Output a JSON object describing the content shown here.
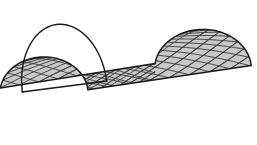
{
  "figure": {
    "kind": "geometric-surface-diagram",
    "background_color": "#ffffff",
    "canvas": {
      "width": 257,
      "height": 145
    }
  },
  "style": {
    "surface_fill_color": "#c9c9c9",
    "mesh_line_color": "#3a3a3a",
    "outline_color": "#1a1a1a",
    "arch_line_color": "#1a1a1a",
    "mesh_line_width": 0.9,
    "outline_width": 1.5,
    "arch_line_width": 1.4
  },
  "geometry": {
    "description": "Half cylinder (barrel vault) drawn in oblique parallel projection. Axis runs from the near-left open arch toward the far-right end.",
    "radius_x": 44,
    "radius_y": 36,
    "near_center": {
      "x": 66,
      "y": 91
    },
    "far_center": {
      "x": 203,
      "y": 69
    },
    "axis_length": 139,
    "arc_start_angle_deg": 180,
    "arc_end_angle_deg": 360,
    "surface_start_angle_deg": 188,
    "surface_end_angle_deg": 355,
    "near_rim_shear_x": -22,
    "near_rim_shear_y": 2,
    "mesh": {
      "family_a_count": 13,
      "family_b_count": 13,
      "family_a_direction": "down-right",
      "family_b_direction": "up-right",
      "twist_turns": 0.62,
      "samples_per_curve": 60
    },
    "open_arch": {
      "apex": {
        "x": 65,
        "y": 24
      },
      "left_foot": {
        "x": 22,
        "y": 92
      },
      "right_foot": {
        "x": 107,
        "y": 81
      },
      "filled": false
    },
    "surface_corners": {
      "top_left": {
        "x": 105,
        "y": 20
      },
      "top_right": {
        "x": 212,
        "y": 13
      },
      "bottom_right": {
        "x": 243,
        "y": 110
      },
      "bottom_left": {
        "x": 113,
        "y": 133
      }
    }
  },
  "chart_data": {
    "type": "scatter",
    "xlabel": "",
    "ylabel": "",
    "x": [],
    "values": [],
    "categories": []
  }
}
